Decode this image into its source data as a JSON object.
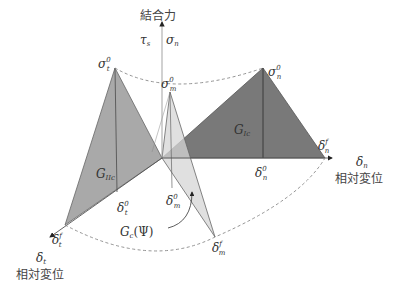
{
  "axes": {
    "vertical_title": "結合力",
    "vertical_symbols": {
      "tau": "τ",
      "tau_sub": "s",
      "sep": "|",
      "sigma": "σ",
      "sigma_sub": "n"
    },
    "normal_axis": {
      "symbol": "δ",
      "sub": "n",
      "title": "相対変位"
    },
    "tangential_axis": {
      "symbol": "δ",
      "sub": "t",
      "title": "相対変位"
    }
  },
  "labels": {
    "sigma_t0": {
      "base": "σ",
      "sup": "0",
      "sub": "t"
    },
    "sigma_m0": {
      "base": "σ",
      "sup": "0",
      "sub": "m"
    },
    "sigma_n0": {
      "base": "σ",
      "sup": "0",
      "sub": "n"
    },
    "delta_n0": {
      "base": "δ",
      "sup": "0",
      "sub": "n"
    },
    "delta_nf": {
      "base": "δ",
      "sup": "f",
      "sub": "n"
    },
    "delta_t0": {
      "base": "δ",
      "sup": "0",
      "sub": "t"
    },
    "delta_tf": {
      "base": "δ",
      "sup": "f",
      "sub": "t"
    },
    "delta_m0": {
      "base": "δ",
      "sup": "0",
      "sub": "m"
    },
    "delta_mf": {
      "base": "δ",
      "sup": "f",
      "sub": "m"
    },
    "G_Ic": {
      "base": "G",
      "sub": "Ic"
    },
    "G_IIc": {
      "base": "G",
      "sub": "IIc"
    },
    "G_c_psi": {
      "base": "G",
      "sub": "c",
      "arg": "(Ψ)"
    }
  },
  "colors": {
    "mode_I_fill": "#6e6e6e",
    "mode_II_fill": "#a9a9a9",
    "mixed_fill": "#d6d6d6",
    "edge": "#555555",
    "dashed": "#888888",
    "axis": "#999999"
  }
}
